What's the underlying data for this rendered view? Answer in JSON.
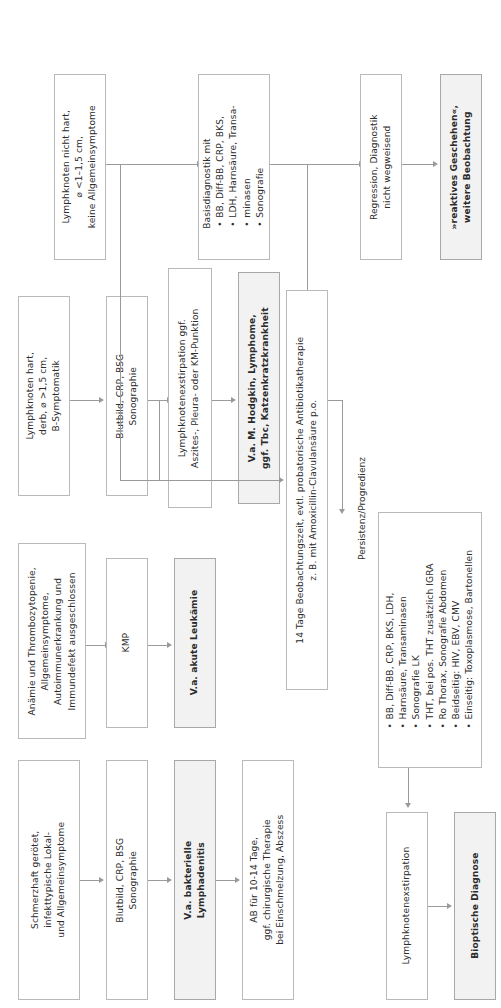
{
  "diagram": {
    "orientation": "text-rotated-90-ccw",
    "accent_border": "#b9b9b9",
    "shaded_fill": "#f2f2f2",
    "connector_color": "#9a9a9a"
  },
  "rows": {
    "row1": {
      "name": "Schmerzhafte bakterielle Lymphadenitis",
      "nodes": {
        "symptoms": "Schmerzhaft gerötet,\ninfekttypische Lokal-\nund Allgemeinsymptome",
        "symptoms_l1": "Schmerzhaft gerötet,",
        "symptoms_l2": "infekttypische Lokal-",
        "symptoms_l3": "und Allgemeinsymptome",
        "diagnostics_l1": "Blutbild, CRP, BSG",
        "diagnostics_l2": "Sonographie",
        "suspicion_l1": "V.a. bakterielle",
        "suspicion_l2": "Lymphadenitis",
        "therapy_l1": "AB für 10-14 Tage,",
        "therapy_l2": "ggf. chirurgische Therapie",
        "therapy_l3": "bei Einschmelzung, Abszess"
      }
    },
    "row2": {
      "name": "Anaemie und Thrombozytopenie / akute Leukaemie",
      "nodes": {
        "symptoms_l1": "Anämie und Thrombozytopenie,",
        "symptoms_l2": "Allgemeinsymptome,",
        "symptoms_l3": "Autoimmunerkrankung und",
        "symptoms_l4": "Immundefekt ausgeschlossen",
        "diagnostics": "KMP",
        "suspicion": "V.a. akute Leukämie"
      }
    },
    "row3": {
      "name": "Lymphknoten hart, derb",
      "nodes": {
        "symptoms_l1": "Lymphknoten hart,",
        "symptoms_l2": "derb, ⌀ >1,5 cm,",
        "symptoms_l3": "B-Symptomatik",
        "diagnostics_l1": "Blutbild, CRP, BSG",
        "diagnostics_l2": "Sonographie",
        "extirpation_l1": "Lymphknotenexstirpation ggf.",
        "extirpation_l2": "Aszites-, Pleura- oder KM-Punktion",
        "suspicion_l1": "V.a. M. Hodgkin, Lymphome,",
        "suspicion_l2": "ggf. Tbc, Katzenkratzkrankheit"
      }
    },
    "row4": {
      "name": "Lymphknoten nicht hart",
      "nodes": {
        "symptoms_l1": "Lymphknoten nicht hart,",
        "symptoms_l2": "⌀ <1–1,5 cm,",
        "symptoms_l3": "keine Allgemeinsymptome",
        "basis_header": "Basisdiagnostik mit",
        "basis_bullets": [
          "BB, Diff-BB, CRP, BKS,",
          "LDH, Harnsäure, Transa-",
          "minasen",
          "Sonografie"
        ],
        "basis_b1_l1": "BB, Diff-BB, CRP, BKS,",
        "basis_b1_l2": "LDH, Harnsäure, Transa-",
        "basis_b1_l3": "minasen",
        "basis_b2": "Sonografie",
        "regression_l1": "Regression, Diagnostik",
        "regression_l2": "nicht wegweisend",
        "reactive_l1": "»reaktives Geschehen«,",
        "reactive_l2": "weitere Beobachtung"
      }
    }
  },
  "center": {
    "observation_l1": "14 Tage Beobachtungszeit, evtl. probatorische Antibiotikatherapie",
    "observation_l2": "z. B. mit Amoxicillin-Clavulansäure p.o.",
    "edge_label_persistenz": "Persistenz/Progredienz"
  },
  "extended": {
    "bullets": [
      "BB, Diff-BB, CRP, BKS, LDH,",
      "Harnsäure, Transaminasen",
      "Sonografie LK",
      "THT, bei pos. THT zusätzlich IGRA",
      "Ro Thorax, Sonografie Abdomen",
      "Beidseitig: HIV, EBV, CMV",
      "Einseitig: Toxoplasmose, Bartonellen"
    ],
    "b1_l1": "BB, Diff-BB, CRP, BKS, LDH,",
    "b1_l2": "Harnsäure, Transaminasen",
    "b2": "Sonografie LK",
    "b3": "THT, bei pos. THT zusätzlich IGRA",
    "b4": "Ro Thorax, Sonografie Abdomen",
    "b5": "Beidseitig: HIV, EBV, CMV",
    "b6": "Einseitig: Toxoplasmose, Bartonellen",
    "exstirpation": "Lymphknotenexstirpation",
    "bioptic": "Bioptische Diagnose"
  }
}
